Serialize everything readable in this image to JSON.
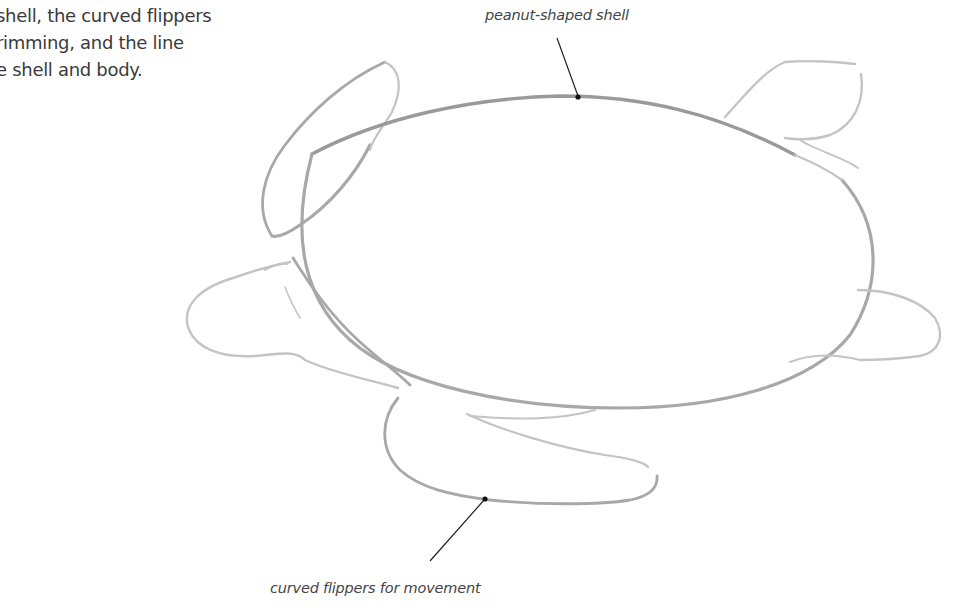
{
  "intro": {
    "lines": [
      "shell, the curved flippers",
      "rimming, and the line",
      "e shell and body."
    ]
  },
  "annotations": {
    "shell": "peanut-shaped shell",
    "flippers": "curved flippers for movement"
  },
  "drawing": {
    "subject": "sea turtle pencil sketch",
    "stroke_color": "#a8a8a8",
    "leader_color": "#222222"
  }
}
